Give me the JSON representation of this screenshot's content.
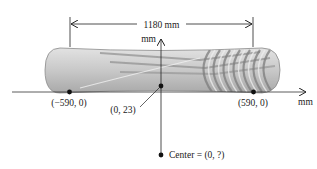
{
  "figure": {
    "type": "snowboard-curvature-diagram",
    "dimension_label": "1180 mm",
    "axis_labels": {
      "vertical": "mm",
      "horizontal": "mm"
    },
    "points": [
      {
        "id": "left-end",
        "label": "(−590, 0)"
      },
      {
        "id": "center-top",
        "label": "(0, 23)"
      },
      {
        "id": "right-end",
        "label": "(590, 0)"
      },
      {
        "id": "center",
        "label": "Center = (0, ?)"
      }
    ],
    "colors": {
      "board_fill": "#c9c9c9",
      "board_stripe": "#8f8f8f",
      "line": "#222222",
      "point": "#111111"
    }
  }
}
